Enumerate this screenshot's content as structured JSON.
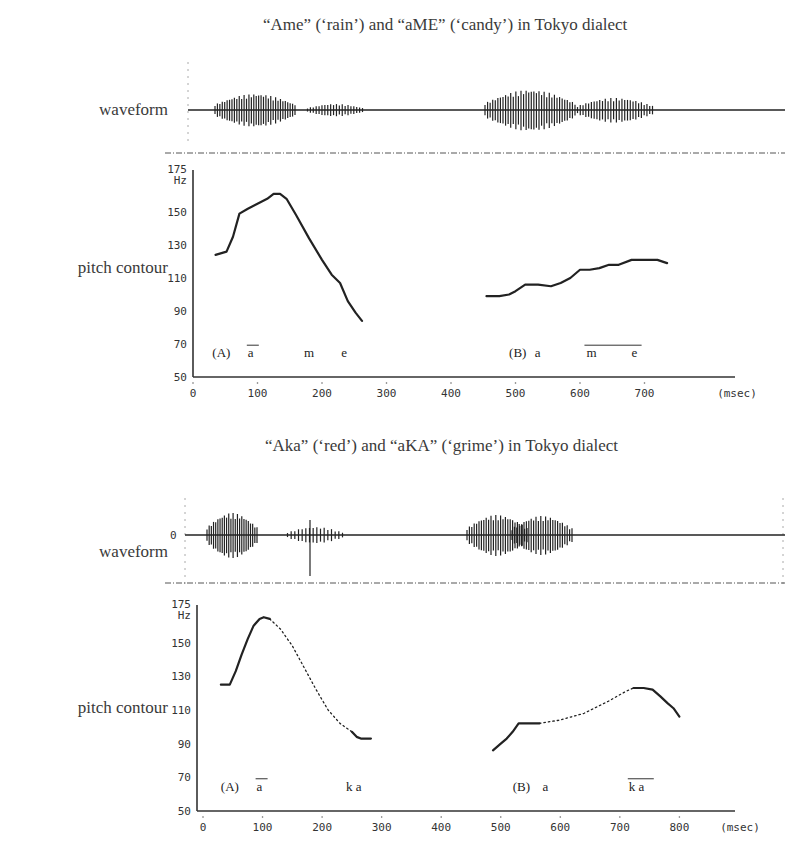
{
  "figure_top_fragment": "",
  "row_labels": {
    "waveform": "waveform",
    "pitch": "pitch contour"
  },
  "chart_data": [
    {
      "type": "line",
      "title": "“Ame” (‘rain’) and “aME” (‘candy’) in Tokyo dialect",
      "xlabel": "(msec)",
      "ylabel": "Hz",
      "xlim": [
        0,
        800
      ],
      "ylim": [
        50,
        175
      ],
      "xticks": [
        0,
        100,
        200,
        300,
        400,
        500,
        600,
        700
      ],
      "yticks": [
        50,
        70,
        90,
        110,
        130,
        150,
        175
      ],
      "grid": false,
      "series": [
        {
          "name": "(A) Ame",
          "style": "solid",
          "x": [
            35,
            52,
            62,
            72,
            85,
            100,
            115,
            125,
            135,
            145,
            160,
            180,
            200,
            215,
            228,
            240,
            252,
            262
          ],
          "y": [
            124,
            126,
            135,
            149,
            152,
            155,
            158,
            161,
            161,
            158,
            148,
            134,
            121,
            112,
            107,
            96,
            89,
            84
          ]
        },
        {
          "name": "(B) aME",
          "style": "solid",
          "x": [
            455,
            475,
            490,
            500,
            515,
            535,
            555,
            570,
            585,
            600,
            615,
            630,
            645,
            660,
            680,
            700,
            720,
            735
          ],
          "y": [
            99,
            99,
            100,
            102,
            106,
            106,
            105,
            107,
            110,
            115,
            115,
            116,
            118,
            118,
            121,
            121,
            121,
            119
          ]
        }
      ],
      "annotations": [
        {
          "text": "(A)",
          "x": 30,
          "y": 62
        },
        {
          "text": "a",
          "x": 85,
          "y": 62,
          "overline": true
        },
        {
          "text": "m",
          "x": 172,
          "y": 62
        },
        {
          "text": "e",
          "x": 230,
          "y": 62
        },
        {
          "text": "(B)",
          "x": 490,
          "y": 62
        },
        {
          "text": "a",
          "x": 530,
          "y": 62
        },
        {
          "text": "m",
          "x": 610,
          "y": 62,
          "overline_group": "me1"
        },
        {
          "text": "e",
          "x": 680,
          "y": 62,
          "overline_group": "me1"
        }
      ]
    },
    {
      "type": "line",
      "title": "“Aka” (‘red’) and “aKA” (‘grime’) in Tokyo dialect",
      "xlabel": "(msec)",
      "ylabel": "Hz",
      "xlim": [
        0,
        900
      ],
      "ylim": [
        50,
        175
      ],
      "xticks": [
        0,
        100,
        200,
        300,
        400,
        500,
        600,
        700,
        800
      ],
      "yticks": [
        50,
        70,
        90,
        110,
        130,
        150,
        175
      ],
      "waveform_zero_label": "0",
      "grid": false,
      "series": [
        {
          "name": "(A) Aka voiced a",
          "style": "solid",
          "x": [
            30,
            45,
            55,
            65,
            75,
            85,
            95,
            102,
            112
          ],
          "y": [
            125,
            125,
            133,
            143,
            152,
            160,
            164,
            165,
            164
          ]
        },
        {
          "name": "(A) Aka interpolated",
          "style": "dotted",
          "x": [
            112,
            130,
            150,
            170,
            190,
            210,
            230,
            250
          ],
          "y": [
            164,
            158,
            148,
            135,
            122,
            110,
            102,
            97
          ]
        },
        {
          "name": "(A) Aka voiced ka",
          "style": "solid",
          "x": [
            250,
            258,
            265,
            275,
            282
          ],
          "y": [
            97,
            94,
            93,
            93,
            93
          ]
        },
        {
          "name": "(B) aKA voiced a",
          "style": "solid",
          "x": [
            487,
            500,
            510,
            520,
            530,
            545,
            565
          ],
          "y": [
            86,
            90,
            93,
            97,
            102,
            102,
            102
          ]
        },
        {
          "name": "(B) aKA interpolated",
          "style": "dotted",
          "x": [
            565,
            600,
            640,
            680,
            710,
            723
          ],
          "y": [
            102,
            104,
            108,
            115,
            121,
            123
          ]
        },
        {
          "name": "(B) aKA voiced ka",
          "style": "solid",
          "x": [
            723,
            740,
            755,
            768,
            780,
            790,
            800
          ],
          "y": [
            123,
            123,
            122,
            118,
            114,
            111,
            106
          ]
        }
      ],
      "annotations": [
        {
          "text": "(A)",
          "x": 30,
          "y": 62
        },
        {
          "text": "a",
          "x": 90,
          "y": 62,
          "overline": true
        },
        {
          "text": "k a",
          "x": 240,
          "y": 62
        },
        {
          "text": "(B)",
          "x": 520,
          "y": 62
        },
        {
          "text": "a",
          "x": 570,
          "y": 62
        },
        {
          "text": "k a",
          "x": 715,
          "y": 62,
          "overline": true
        }
      ]
    }
  ]
}
